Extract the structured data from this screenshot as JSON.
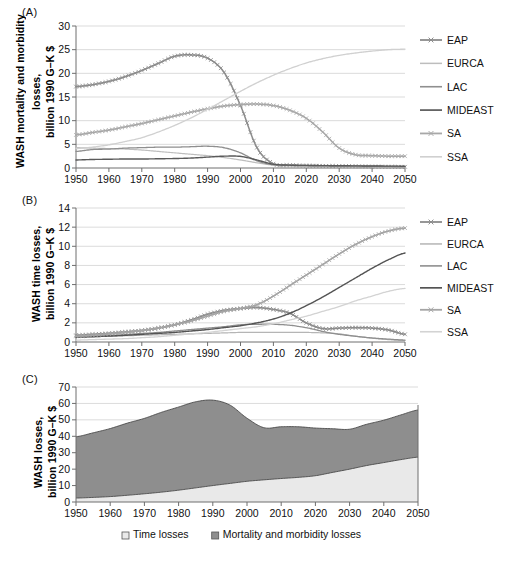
{
  "figure": {
    "panels": [
      {
        "tag": "(A)",
        "ylabel_line1": "WASH mortality and morbidity",
        "ylabel_line2": "losses,",
        "ylabel_line3": "billion 1990 G–K $"
      },
      {
        "tag": "(B)",
        "ylabel_line1": "WASH time losses,",
        "ylabel_line2": "billion 1990 G–K $"
      },
      {
        "tag": "(C)",
        "ylabel_line1": "WASH losses,",
        "ylabel_line2": "billion 1990 G–K $"
      }
    ]
  },
  "chart_data": [
    {
      "type": "line",
      "panel": "A",
      "title": "WASH mortality and morbidity losses",
      "xlabel": "",
      "ylabel": "WASH mortality and morbidity losses, billion 1990 G-K $",
      "xlim": [
        1950,
        2050
      ],
      "ylim": [
        0,
        30
      ],
      "yticks": [
        0,
        5,
        10,
        15,
        20,
        25,
        30
      ],
      "xticks": [
        1950,
        1960,
        1970,
        1980,
        1990,
        2000,
        2010,
        2020,
        2030,
        2040,
        2050
      ],
      "grid": true,
      "legend_position": "right",
      "x": [
        1950,
        1955,
        1960,
        1965,
        1970,
        1975,
        1980,
        1985,
        1990,
        1995,
        2000,
        2005,
        2010,
        2015,
        2020,
        2025,
        2030,
        2035,
        2040,
        2045,
        2050
      ],
      "series": [
        {
          "name": "EAP",
          "color": "#8c8c8c",
          "marker": "x",
          "width": 1.5,
          "values": [
            17.2,
            17.6,
            18.3,
            19.3,
            20.6,
            22.1,
            23.6,
            23.9,
            23.2,
            20.2,
            13.2,
            4.3,
            0.9,
            0.6,
            0.5,
            0.45,
            0.4,
            0.35,
            0.3,
            0.28,
            0.25
          ]
        },
        {
          "name": "EURCA",
          "color": "#bdbdbd",
          "marker": "none",
          "width": 1.2,
          "values": [
            4.3,
            4.2,
            4.1,
            4.0,
            3.8,
            3.5,
            3.2,
            2.9,
            2.6,
            2.2,
            1.7,
            1.1,
            0.6,
            0.45,
            0.4,
            0.35,
            0.3,
            0.28,
            0.26,
            0.24,
            0.22
          ]
        },
        {
          "name": "LAC",
          "color": "#8f8f8f",
          "marker": "none",
          "width": 1.3,
          "values": [
            3.5,
            3.9,
            4.0,
            4.2,
            4.3,
            4.4,
            4.4,
            4.5,
            4.6,
            4.3,
            3.2,
            1.5,
            0.7,
            0.55,
            0.5,
            0.45,
            0.4,
            0.38,
            0.35,
            0.33,
            0.3
          ]
        },
        {
          "name": "MIDEAST",
          "color": "#5a5a5a",
          "marker": "none",
          "width": 1.4,
          "values": [
            1.7,
            1.8,
            1.85,
            1.9,
            1.9,
            1.95,
            2.0,
            2.1,
            2.3,
            2.5,
            2.45,
            1.7,
            0.8,
            0.6,
            0.55,
            0.5,
            0.48,
            0.45,
            0.42,
            0.4,
            0.38
          ]
        },
        {
          "name": "SA",
          "color": "#a8a8a8",
          "marker": "x",
          "width": 1.5,
          "values": [
            7.0,
            7.5,
            8.0,
            8.7,
            9.4,
            10.2,
            11.0,
            11.8,
            12.5,
            13.1,
            13.4,
            13.5,
            13.2,
            12.2,
            10.5,
            7.6,
            4.2,
            2.8,
            2.6,
            2.5,
            2.5
          ]
        },
        {
          "name": "SSA",
          "color": "#d0d0d0",
          "marker": "none",
          "width": 1.3,
          "values": [
            4.1,
            4.4,
            4.9,
            5.6,
            6.4,
            7.6,
            9.0,
            10.6,
            12.4,
            14.3,
            16.2,
            18.0,
            19.6,
            21.0,
            22.2,
            23.1,
            23.8,
            24.3,
            24.7,
            25.0,
            25.1
          ]
        }
      ]
    },
    {
      "type": "line",
      "panel": "B",
      "title": "WASH time losses",
      "xlabel": "",
      "ylabel": "WASH time losses, billion 1990 G-K $",
      "xlim": [
        1950,
        2050
      ],
      "ylim": [
        0,
        14
      ],
      "yticks": [
        0,
        2,
        4,
        6,
        8,
        10,
        12,
        14
      ],
      "xticks": [
        1950,
        1960,
        1970,
        1980,
        1990,
        2000,
        2010,
        2020,
        2030,
        2040,
        2050
      ],
      "grid": true,
      "legend_position": "right",
      "x": [
        1950,
        1955,
        1960,
        1965,
        1970,
        1975,
        1980,
        1985,
        1990,
        1995,
        2000,
        2005,
        2010,
        2015,
        2020,
        2025,
        2030,
        2035,
        2040,
        2045,
        2050
      ],
      "series": [
        {
          "name": "EAP",
          "color": "#8c8c8c",
          "marker": "x",
          "width": 1.5,
          "values": [
            0.7,
            0.8,
            0.9,
            1.05,
            1.2,
            1.45,
            1.8,
            2.3,
            2.9,
            3.3,
            3.5,
            3.6,
            3.4,
            3.0,
            2.0,
            1.4,
            1.45,
            1.5,
            1.45,
            1.25,
            0.8
          ]
        },
        {
          "name": "EURCA",
          "color": "#b5b5b5",
          "marker": "none",
          "width": 1.2,
          "values": [
            0.5,
            0.55,
            0.6,
            0.65,
            0.7,
            0.75,
            0.8,
            0.85,
            0.9,
            0.95,
            1.0,
            1.0,
            1.0,
            1.0,
            1.0,
            0.95,
            0.85,
            0.6,
            0.4,
            0.25,
            0.15
          ]
        },
        {
          "name": "LAC",
          "color": "#8f8f8f",
          "marker": "none",
          "width": 1.3,
          "values": [
            0.55,
            0.6,
            0.68,
            0.78,
            0.9,
            1.0,
            1.15,
            1.3,
            1.45,
            1.6,
            1.8,
            1.85,
            1.85,
            1.75,
            1.5,
            1.1,
            0.8,
            0.6,
            0.42,
            0.3,
            0.2
          ]
        },
        {
          "name": "MIDEAST",
          "color": "#545454",
          "marker": "none",
          "width": 1.4,
          "values": [
            0.5,
            0.55,
            0.62,
            0.7,
            0.8,
            0.9,
            1.0,
            1.15,
            1.3,
            1.5,
            1.7,
            2.0,
            2.4,
            3.0,
            3.8,
            4.7,
            5.7,
            6.7,
            7.7,
            8.6,
            9.3
          ]
        },
        {
          "name": "SA",
          "color": "#a5a5a5",
          "marker": "x",
          "width": 1.5,
          "values": [
            0.6,
            0.7,
            0.85,
            1.0,
            1.2,
            1.45,
            1.8,
            2.2,
            2.7,
            3.2,
            3.5,
            3.9,
            4.8,
            5.9,
            7.0,
            8.1,
            9.2,
            10.2,
            11.0,
            11.6,
            11.9
          ]
        },
        {
          "name": "SSA",
          "color": "#d3d3d3",
          "marker": "none",
          "width": 1.3,
          "values": [
            0.2,
            0.25,
            0.3,
            0.35,
            0.45,
            0.55,
            0.7,
            0.85,
            1.0,
            1.2,
            1.4,
            1.6,
            1.9,
            2.3,
            2.7,
            3.2,
            3.7,
            4.3,
            4.8,
            5.3,
            5.6
          ]
        }
      ]
    },
    {
      "type": "area",
      "panel": "C",
      "stacked": true,
      "title": "WASH losses",
      "xlabel": "",
      "ylabel": "WASH losses, billion 1990 G-K $",
      "xlim": [
        1950,
        2050
      ],
      "ylim": [
        0,
        70
      ],
      "yticks": [
        0,
        10,
        20,
        30,
        40,
        50,
        60,
        70
      ],
      "xticks": [
        1950,
        1960,
        1970,
        1980,
        1990,
        2000,
        2010,
        2020,
        2030,
        2040,
        2050
      ],
      "grid": true,
      "legend_position": "bottom",
      "x": [
        1950,
        1955,
        1960,
        1965,
        1970,
        1975,
        1980,
        1985,
        1990,
        1995,
        2000,
        2005,
        2010,
        2015,
        2020,
        2025,
        2030,
        2035,
        2040,
        2045,
        2050
      ],
      "series": [
        {
          "name": "Time losses",
          "color": "#e9e9e9",
          "values": [
            2.4,
            2.8,
            3.3,
            4.1,
            5.0,
            6.0,
            7.2,
            8.6,
            10.0,
            11.3,
            12.6,
            13.5,
            14.3,
            15.0,
            16.0,
            18.0,
            20.0,
            22.2,
            24.0,
            25.8,
            27.3
          ]
        },
        {
          "name": "Mortality and morbidity losses",
          "color": "#8e8e8e",
          "values": [
            37.3,
            39.3,
            41.4,
            43.9,
            45.9,
            48.6,
            50.6,
            52.4,
            52.0,
            47.7,
            38.4,
            31.7,
            31.5,
            30.8,
            29.0,
            26.6,
            24.3,
            25.1,
            25.8,
            27.2,
            28.7
          ]
        }
      ]
    }
  ]
}
